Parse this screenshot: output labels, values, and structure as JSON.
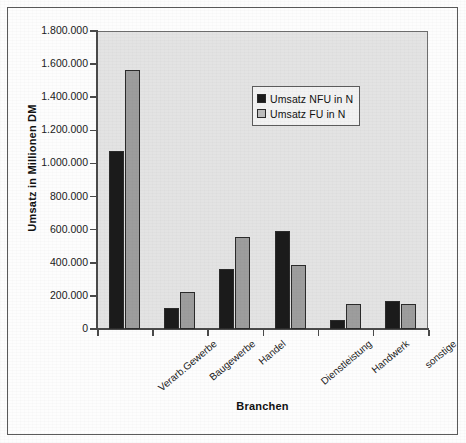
{
  "chart_data": {
    "type": "bar",
    "title": "",
    "xlabel": "Branchen",
    "ylabel": "Umsatz in Millionen DM",
    "categories": [
      "Verarb.Gewerbe",
      "Baugewerbe",
      "Handel",
      "Dienstleistung",
      "Handwerk",
      "sonstige"
    ],
    "series": [
      {
        "name": "Umsatz NFU in N",
        "color": "#1b1b1b",
        "values": [
          1075000,
          125000,
          365000,
          590000,
          55000,
          170000
        ]
      },
      {
        "name": "Umsatz FU in N",
        "color": "#9d9d9d",
        "values": [
          1565000,
          222000,
          553000,
          388000,
          148000,
          150000
        ]
      }
    ],
    "ylim": [
      0,
      1800000
    ],
    "ytick_values": [
      0,
      200000,
      400000,
      600000,
      800000,
      1000000,
      1200000,
      1400000,
      1600000,
      1800000
    ],
    "ytick_labels": [
      "0",
      "200.000",
      "400.000",
      "600.000",
      "800.000",
      "1.000.000",
      "1.200.000",
      "1.400.000",
      "1.600.000",
      "1.800.000"
    ],
    "grid": false,
    "legend_position": "inside-top-right",
    "plot_background": "#e3e3e3",
    "frame": true
  },
  "legend": {
    "entries": [
      {
        "label": "Umsatz NFU in N",
        "swatch": "black-square-swatch"
      },
      {
        "label": "Umsatz FU in N",
        "swatch": "gray-square-swatch"
      }
    ]
  },
  "axes": {
    "y_title": "Umsatz in Millionen DM",
    "x_title": "Branchen"
  }
}
